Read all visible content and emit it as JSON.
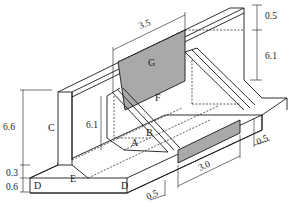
{
  "diagram": {
    "type": "isometric structural drawing",
    "regions": [
      {
        "id": "A",
        "label": "A"
      },
      {
        "id": "B",
        "label": "B"
      },
      {
        "id": "C",
        "label": "C"
      },
      {
        "id": "D1",
        "label": "D"
      },
      {
        "id": "D2",
        "label": "D"
      },
      {
        "id": "E",
        "label": "E"
      },
      {
        "id": "F",
        "label": "F",
        "shaded": true
      },
      {
        "id": "G",
        "label": "G"
      }
    ],
    "dimensions": {
      "top_width": "3.5",
      "top_thickness": "0.5",
      "wall_height_right": "6.1",
      "wall_height_left": "6.6",
      "inner_height": "6.1",
      "base_step": "0.3",
      "base_thickness": "0.6",
      "strip_length": "3.0",
      "edge_offset_right": "0.5",
      "edge_offset_bottom": "0.5"
    },
    "colors": {
      "line": "#1a1a1a",
      "shade": "#a9a9a9",
      "background": "#ffffff"
    }
  }
}
